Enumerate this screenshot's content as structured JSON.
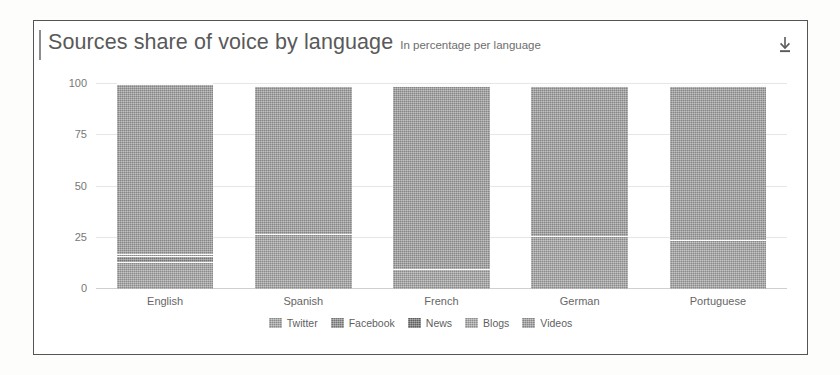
{
  "panel": {
    "download_icon": "download-icon"
  },
  "header": {
    "title": "Sources share of voice by language",
    "subtitle": "In percentage per language"
  },
  "chart_data": {
    "type": "bar",
    "stacked": true,
    "title": "Sources share of voice by language",
    "subtitle": "In percentage per language",
    "xlabel": "",
    "ylabel": "",
    "ylim": [
      0,
      100
    ],
    "yticks": [
      0,
      25,
      50,
      75,
      100
    ],
    "ytick_labels": [
      "0",
      "25",
      "50",
      "75",
      "100"
    ],
    "grid": true,
    "legend_position": "bottom",
    "categories": [
      "English",
      "Spanish",
      "French",
      "German",
      "Portuguese"
    ],
    "series": [
      {
        "name": "Twitter",
        "color": "#a0a0a0",
        "values": [
          13,
          27,
          10,
          26,
          24
        ]
      },
      {
        "name": "Facebook",
        "color": "#8a8a8a",
        "values": [
          3,
          0,
          0,
          0,
          0
        ]
      },
      {
        "name": "News",
        "color": "#6f6f6f",
        "values": [
          1,
          0,
          0,
          0,
          0
        ]
      },
      {
        "name": "Blogs",
        "color": "#9a9a9a",
        "values": [
          0,
          0,
          0,
          0,
          0
        ]
      },
      {
        "name": "Videos",
        "color": "#9a9a9a",
        "values": [
          83,
          72,
          89,
          73,
          75
        ]
      }
    ],
    "bar_totals": [
      100,
      99,
      99,
      99,
      99
    ]
  },
  "legend": {
    "items": [
      {
        "label": "Twitter",
        "color": "#a2a2a2"
      },
      {
        "label": "Facebook",
        "color": "#888888"
      },
      {
        "label": "News",
        "color": "#6e6e6e"
      },
      {
        "label": "Blogs",
        "color": "#a6a6a6"
      },
      {
        "label": "Videos",
        "color": "#9b9b9b"
      }
    ]
  }
}
